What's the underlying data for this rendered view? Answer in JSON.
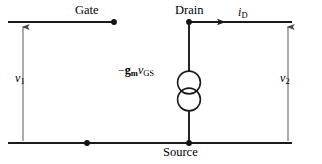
{
  "diagram": {
    "terminals": {
      "gate": "Gate",
      "drain": "Drain",
      "source": "Source"
    },
    "currents": {
      "drain_current_symbol": "i",
      "drain_current_subscript": "D"
    },
    "voltages": {
      "input_symbol": "v",
      "input_subscript": "1",
      "output_symbol": "v",
      "output_subscript": "2"
    },
    "dependent_source": {
      "sign": "−",
      "transconductance": "g",
      "transconductance_subscript": "m",
      "control_voltage": "v",
      "control_voltage_subscript": "GS",
      "symbol_name": "dependent-current-source"
    },
    "colors": {
      "wire": "#1a1a1a",
      "arrow": "#6e6e6e",
      "text": "#000000",
      "background": "#ffffff"
    }
  }
}
